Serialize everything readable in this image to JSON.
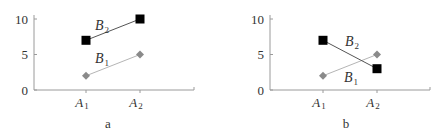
{
  "chart_data": [
    {
      "type": "line",
      "title": "",
      "panel_label": "a",
      "categories": [
        "A1",
        "A2"
      ],
      "category_display": [
        {
          "main": "A",
          "sub": "1"
        },
        {
          "main": "A",
          "sub": "2"
        }
      ],
      "xlabel": "",
      "ylabel": "",
      "ylim": [
        0,
        10
      ],
      "yticks": [
        0,
        5,
        10
      ],
      "grid": false,
      "legend": "inline labels",
      "series": [
        {
          "name": "B1",
          "display": {
            "main": "B",
            "sub": "1"
          },
          "values": [
            2,
            5
          ],
          "marker": "diamond",
          "color": "#8a8a8a",
          "line_color": "#b5b5b5"
        },
        {
          "name": "B2",
          "display": {
            "main": "B",
            "sub": "2"
          },
          "values": [
            7,
            10
          ],
          "marker": "square",
          "color": "#000000",
          "line_color": "#555555"
        }
      ]
    },
    {
      "type": "line",
      "title": "",
      "panel_label": "b",
      "categories": [
        "A1",
        "A2"
      ],
      "category_display": [
        {
          "main": "A",
          "sub": "1"
        },
        {
          "main": "A",
          "sub": "2"
        }
      ],
      "xlabel": "",
      "ylabel": "",
      "ylim": [
        0,
        10
      ],
      "yticks": [
        0,
        5,
        10
      ],
      "grid": false,
      "legend": "inline labels",
      "series": [
        {
          "name": "B1",
          "display": {
            "main": "B",
            "sub": "1"
          },
          "values": [
            2,
            5
          ],
          "marker": "diamond",
          "color": "#8a8a8a",
          "line_color": "#b5b5b5"
        },
        {
          "name": "B2",
          "display": {
            "main": "B",
            "sub": "2"
          },
          "values": [
            7,
            3
          ],
          "marker": "square",
          "color": "#000000",
          "line_color": "#555555"
        }
      ]
    }
  ],
  "labels": {
    "panel_a": "a",
    "panel_b": "b",
    "y0": "0",
    "y5": "5",
    "y10": "10",
    "A": "A",
    "B": "B",
    "sub1": "1",
    "sub2": "2"
  }
}
